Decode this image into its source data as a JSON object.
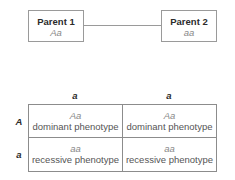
{
  "parents": [
    {
      "label": "Parent 1",
      "genotype": "Aa"
    },
    {
      "label": "Parent 2",
      "genotype": "aa"
    }
  ],
  "punnett": {
    "column_alleles": [
      "a",
      "a"
    ],
    "row_alleles": [
      "A",
      "a"
    ],
    "cells": [
      [
        {
          "genotype": "Aa",
          "phenotype": "dominant phenotype"
        },
        {
          "genotype": "Aa",
          "phenotype": "dominant phenotype"
        }
      ],
      [
        {
          "genotype": "aa",
          "phenotype": "recessive phenotype"
        },
        {
          "genotype": "aa",
          "phenotype": "recessive phenotype"
        }
      ]
    ]
  },
  "colors": {
    "border": "#9a9a9a",
    "title_text": "#2b2b2b",
    "genotype_text": "#888888",
    "phenotype_text": "#555555"
  }
}
